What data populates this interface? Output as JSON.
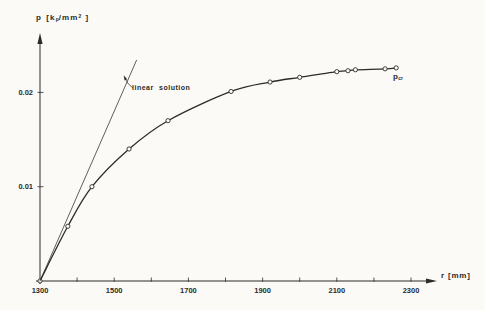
{
  "figure": {
    "background": "#fbfaf7",
    "ink": "#2b2b2b"
  },
  "y_axis_label": {
    "symbol": "p",
    "bracket_open": "[",
    "unit_main": "k",
    "unit_sub": "p",
    "unit_rest": "/mm",
    "unit_sup": "2",
    "bracket_close": "]"
  },
  "x_axis_label": {
    "text": "r [mm]"
  },
  "annotations": {
    "linear_solution": "linear solution",
    "p_cr_main": "p",
    "p_cr_sub": "cr"
  },
  "chart_data": {
    "type": "line",
    "title": "",
    "xlabel": "r [mm]",
    "ylabel": "p [kp/mm²]",
    "xlim": [
      1300,
      2370
    ],
    "ylim": [
      0,
      0.0263
    ],
    "grid": false,
    "x_ticks_labeled": [
      {
        "value": 1300,
        "label": "1300"
      },
      {
        "value": 1500,
        "label": "1500"
      },
      {
        "value": 1700,
        "label": "1700"
      },
      {
        "value": 1900,
        "label": "1900"
      },
      {
        "value": 2100,
        "label": "2100"
      },
      {
        "value": 2300,
        "label": "2300"
      }
    ],
    "x_ticks_minor": [
      1400,
      1500,
      1600,
      1700,
      1800,
      1900,
      2000,
      2100,
      2200,
      2300
    ],
    "y_ticks": [
      {
        "value": 0.01,
        "label": "0.01"
      },
      {
        "value": 0.02,
        "label": "0.02"
      }
    ],
    "series": [
      {
        "name": "solution curve",
        "marker": "circle",
        "smooth": true,
        "stroke_width": 1.3,
        "points": [
          [
            1300,
            0
          ],
          [
            1375,
            0.0058
          ],
          [
            1440,
            0.01
          ],
          [
            1540,
            0.014
          ],
          [
            1645,
            0.017
          ],
          [
            1815,
            0.0201
          ],
          [
            1920,
            0.0211
          ],
          [
            2000,
            0.0216
          ],
          [
            2100,
            0.0222
          ],
          [
            2130,
            0.0223
          ],
          [
            2150,
            0.0224
          ],
          [
            2230,
            0.0225
          ],
          [
            2260,
            0.0226
          ]
        ]
      },
      {
        "name": "linear solution",
        "marker": "none",
        "smooth": false,
        "stroke_width": 0.75,
        "points": [
          [
            1300,
            0
          ],
          [
            1560,
            0.0234
          ]
        ]
      }
    ],
    "annotations": [
      {
        "text": "linear solution",
        "points_to": "linear solution line"
      },
      {
        "text": "p_cr",
        "meaning": "critical pressure level at end of curve"
      }
    ]
  }
}
